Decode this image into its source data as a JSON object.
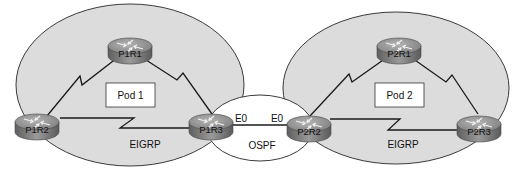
{
  "diagram": {
    "pods": [
      {
        "id": "pod1",
        "label": "Pod 1",
        "protocol": "EIGRP",
        "routers": [
          "P1R1",
          "P1R2",
          "P1R3"
        ]
      },
      {
        "id": "pod2",
        "label": "Pod 2",
        "protocol": "EIGRP",
        "routers": [
          "P2R1",
          "P2R2",
          "P2R3"
        ]
      }
    ],
    "routers": {
      "p1r1": "P1R1",
      "p1r2": "P1R2",
      "p1r3": "P1R3",
      "p2r1": "P2R1",
      "p2r2": "P2R2",
      "p2r3": "P2R3"
    },
    "pod1_label": "Pod 1",
    "pod2_label": "Pod 2",
    "pod1_protocol": "EIGRP",
    "pod2_protocol": "EIGRP",
    "interconnect": {
      "protocol": "OSPF",
      "left_interface": "E0",
      "right_interface": "E0"
    },
    "links": [
      {
        "from": "P1R1",
        "to": "P1R2",
        "type": "serial"
      },
      {
        "from": "P1R1",
        "to": "P1R3",
        "type": "serial"
      },
      {
        "from": "P1R2",
        "to": "P1R3",
        "type": "serial"
      },
      {
        "from": "P2R1",
        "to": "P2R2",
        "type": "serial"
      },
      {
        "from": "P2R1",
        "to": "P2R3",
        "type": "serial"
      },
      {
        "from": "P2R2",
        "to": "P2R3",
        "type": "serial"
      },
      {
        "from": "P1R3",
        "to": "P2R2",
        "type": "ethernet"
      }
    ],
    "colors": {
      "pod_fill": "#dcdcdc",
      "pod_stroke": "#3a3a3a",
      "router_top": "#8f8f8f",
      "router_side": "#6e6e6e",
      "line": "#1a1a1a"
    }
  }
}
